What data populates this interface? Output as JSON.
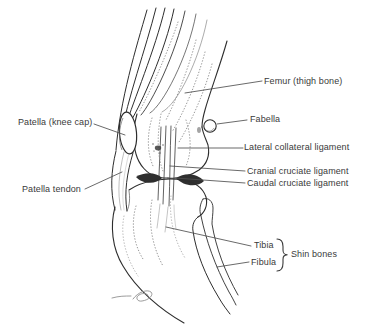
{
  "diagram": {
    "background_color": "#ffffff",
    "ink_color": "#2d2d2d",
    "label_text_color": "#3a3a3a",
    "labels": {
      "femur": "Femur (thigh bone)",
      "patella": "Patella (knee cap)",
      "fabella": "Fabella",
      "lateral_collateral_ligament": "Lateral collateral ligament",
      "cranial_cruciate_ligament": "Cranial cruciate ligament",
      "caudal_cruciate_ligament": "Caudal cruciate ligament",
      "patella_tendon": "Patella tendon",
      "tibia": "Tibia",
      "fibula": "Fibula",
      "shin_bones_group": "Shin bones"
    }
  }
}
